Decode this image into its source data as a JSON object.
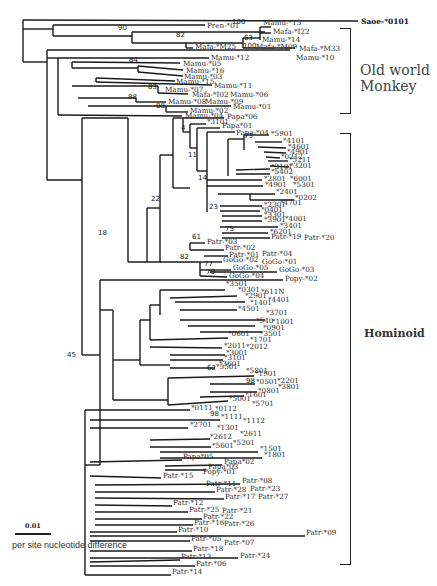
{
  "figure": {
    "type": "phylogenetic-tree",
    "outgroup": "Saoe-*0101",
    "groups": [
      {
        "label_line1": "Old world",
        "label_line2": "Monkey"
      },
      {
        "label": "Hominoid"
      }
    ],
    "scale": {
      "value": "0.01",
      "caption": "per site nucleotide difference"
    }
  },
  "leaves": [
    {
      "t": "Saoe-*0101",
      "x": 361,
      "y": 22,
      "bold": true
    },
    {
      "t": "Pren-*01",
      "x": 207,
      "y": 26
    },
    {
      "t": "Mamu-*13",
      "x": 263,
      "y": 23
    },
    {
      "t": "Mafa-*I22",
      "x": 273,
      "y": 32
    },
    {
      "t": "Mamu-*14",
      "x": 262,
      "y": 40
    },
    {
      "t": "Mafa-*M25",
      "x": 195,
      "y": 47
    },
    {
      "t": "Mafa-*M09",
      "x": 256,
      "y": 47
    },
    {
      "t": "Mafa-*M33",
      "x": 299,
      "y": 49
    },
    {
      "t": "Mamu-*10",
      "x": 296,
      "y": 58
    },
    {
      "t": "Mamu-*12",
      "x": 211,
      "y": 58
    },
    {
      "t": "Mamu-*05",
      "x": 183,
      "y": 64
    },
    {
      "t": "Mamu-*16",
      "x": 186,
      "y": 71
    },
    {
      "t": "Mamu-*03",
      "x": 184,
      "y": 77
    },
    {
      "t": "Mamu-*15",
      "x": 176,
      "y": 82
    },
    {
      "t": "Mamu-*11",
      "x": 214,
      "y": 86
    },
    {
      "t": "Mamu-*07",
      "x": 165,
      "y": 90
    },
    {
      "t": "Mafa-*I02",
      "x": 192,
      "y": 95
    },
    {
      "t": "Mamu-*06",
      "x": 230,
      "y": 95
    },
    {
      "t": "Mamu-*08",
      "x": 168,
      "y": 102
    },
    {
      "t": "Mamu-*09",
      "x": 205,
      "y": 102
    },
    {
      "t": "Mamu-*01",
      "x": 233,
      "y": 107
    },
    {
      "t": "Mamu-*02",
      "x": 190,
      "y": 111
    },
    {
      "t": "Mamu-*04",
      "x": 185,
      "y": 116
    },
    {
      "t": "Papa*06",
      "x": 227,
      "y": 117
    },
    {
      "t": "*3101",
      "x": 207,
      "y": 122
    },
    {
      "t": "Papa*01",
      "x": 222,
      "y": 126
    },
    {
      "t": "Papa-*04",
      "x": 236,
      "y": 133
    },
    {
      "t": "*5901",
      "x": 271,
      "y": 134
    },
    {
      "t": "*4101",
      "x": 283,
      "y": 141
    },
    {
      "t": "*4601",
      "x": 288,
      "y": 147
    },
    {
      "t": "*4901",
      "x": 287,
      "y": 152
    },
    {
      "t": "*0212",
      "x": 281,
      "y": 157
    },
    {
      "t": "*5211",
      "x": 289,
      "y": 160
    },
    {
      "t": "*3201",
      "x": 290,
      "y": 166
    },
    {
      "t": "*3101",
      "x": 271,
      "y": 167
    },
    {
      "t": "*5402",
      "x": 271,
      "y": 172
    },
    {
      "t": "*2801",
      "x": 264,
      "y": 179
    },
    {
      "t": "*6001",
      "x": 290,
      "y": 179
    },
    {
      "t": "*4901",
      "x": 265,
      "y": 185
    },
    {
      "t": "*5301",
      "x": 293,
      "y": 185
    },
    {
      "t": "*2401",
      "x": 276,
      "y": 192
    },
    {
      "t": "*0202",
      "x": 295,
      "y": 198
    },
    {
      "t": "*2301",
      "x": 264,
      "y": 205
    },
    {
      "t": "*4701",
      "x": 280,
      "y": 203
    },
    {
      "t": "*0401",
      "x": 261,
      "y": 210
    },
    {
      "t": "*3301",
      "x": 264,
      "y": 215
    },
    {
      "t": "*3901",
      "x": 264,
      "y": 220
    },
    {
      "t": "*4001",
      "x": 285,
      "y": 219
    },
    {
      "t": "*3401",
      "x": 280,
      "y": 226
    },
    {
      "t": "*6201",
      "x": 270,
      "y": 232
    },
    {
      "t": "Patr-*19",
      "x": 271,
      "y": 237
    },
    {
      "t": "Patr-*20",
      "x": 304,
      "y": 238
    },
    {
      "t": "Patr-*03",
      "x": 207,
      "y": 242
    },
    {
      "t": "Patr-*02",
      "x": 225,
      "y": 248
    },
    {
      "t": "Patr-*01",
      "x": 229,
      "y": 255
    },
    {
      "t": "Patr-*04",
      "x": 262,
      "y": 254
    },
    {
      "t": "GoGo-*02",
      "x": 223,
      "y": 260
    },
    {
      "t": "GoGo-*01",
      "x": 262,
      "y": 262
    },
    {
      "t": "GoGo-*05",
      "x": 233,
      "y": 268
    },
    {
      "t": "GoGo-*03",
      "x": 279,
      "y": 270
    },
    {
      "t": "GoGo-*04",
      "x": 229,
      "y": 276
    },
    {
      "t": "Popy-*02",
      "x": 285,
      "y": 279
    },
    {
      "t": "*3501",
      "x": 226,
      "y": 284
    },
    {
      "t": "*0301",
      "x": 238,
      "y": 290
    },
    {
      "t": "*611N",
      "x": 261,
      "y": 292
    },
    {
      "t": "*2901",
      "x": 245,
      "y": 296
    },
    {
      "t": "*4401",
      "x": 268,
      "y": 300
    },
    {
      "t": "*1401",
      "x": 250,
      "y": 303
    },
    {
      "t": "*4501",
      "x": 238,
      "y": 309
    },
    {
      "t": "*3701",
      "x": 266,
      "y": 313
    },
    {
      "t": "*540",
      "x": 256,
      "y": 321
    },
    {
      "t": "*1001",
      "x": 272,
      "y": 322
    },
    {
      "t": "*0901",
      "x": 263,
      "y": 328
    },
    {
      "t": "*3501",
      "x": 260,
      "y": 334
    },
    {
      "t": "*0601",
      "x": 228,
      "y": 334
    },
    {
      "t": "*1701",
      "x": 250,
      "y": 340
    },
    {
      "t": "*2011",
      "x": 224,
      "y": 346
    },
    {
      "t": "*2012",
      "x": 246,
      "y": 347
    },
    {
      "t": "*3001",
      "x": 226,
      "y": 353
    },
    {
      "t": "*3101",
      "x": 224,
      "y": 358
    },
    {
      "t": "*3601",
      "x": 219,
      "y": 364
    },
    {
      "t": "*5501",
      "x": 216,
      "y": 367
    },
    {
      "t": "*5801",
      "x": 246,
      "y": 371
    },
    {
      "t": "*1901",
      "x": 255,
      "y": 374
    },
    {
      "t": "*0501",
      "x": 256,
      "y": 382
    },
    {
      "t": "*2201",
      "x": 277,
      "y": 381
    },
    {
      "t": "*3801",
      "x": 278,
      "y": 387
    },
    {
      "t": "*0801",
      "x": 258,
      "y": 391
    },
    {
      "t": "*1601",
      "x": 245,
      "y": 395
    },
    {
      "t": "*5001",
      "x": 229,
      "y": 399
    },
    {
      "t": "*5701",
      "x": 252,
      "y": 404
    },
    {
      "t": "*0111",
      "x": 191,
      "y": 408
    },
    {
      "t": "*0112",
      "x": 215,
      "y": 409
    },
    {
      "t": "*1111",
      "x": 221,
      "y": 417
    },
    {
      "t": "*1112",
      "x": 243,
      "y": 421
    },
    {
      "t": "*2701",
      "x": 190,
      "y": 425
    },
    {
      "t": "*1301",
      "x": 217,
      "y": 428
    },
    {
      "t": "*2611",
      "x": 240,
      "y": 434
    },
    {
      "t": "*2612",
      "x": 210,
      "y": 437
    },
    {
      "t": "*5201",
      "x": 233,
      "y": 443
    },
    {
      "t": "*5601",
      "x": 212,
      "y": 446
    },
    {
      "t": "*1501",
      "x": 260,
      "y": 449
    },
    {
      "t": "*1801",
      "x": 264,
      "y": 455
    },
    {
      "t": "Papa*05",
      "x": 183,
      "y": 457
    },
    {
      "t": "Papa*02",
      "x": 224,
      "y": 462
    },
    {
      "t": "Papa*03",
      "x": 208,
      "y": 467
    },
    {
      "t": "Popy-*01",
      "x": 203,
      "y": 472
    },
    {
      "t": "Patr-*15",
      "x": 163,
      "y": 476
    },
    {
      "t": "Patr-*08",
      "x": 242,
      "y": 481
    },
    {
      "t": "Patr-*11",
      "x": 206,
      "y": 484
    },
    {
      "t": "Patr-*28",
      "x": 216,
      "y": 490
    },
    {
      "t": "Patr-*23",
      "x": 250,
      "y": 489
    },
    {
      "t": "Patr-*17",
      "x": 225,
      "y": 497
    },
    {
      "t": "Patr-*27",
      "x": 258,
      "y": 497
    },
    {
      "t": "Patr-*12",
      "x": 173,
      "y": 503
    },
    {
      "t": "Patr-*25",
      "x": 189,
      "y": 510
    },
    {
      "t": "Patr-*21",
      "x": 222,
      "y": 511
    },
    {
      "t": "Patr-*22",
      "x": 203,
      "y": 517
    },
    {
      "t": "Patr-*16",
      "x": 194,
      "y": 523
    },
    {
      "t": "Patr-*26",
      "x": 224,
      "y": 524
    },
    {
      "t": "Patr-*10",
      "x": 178,
      "y": 530
    },
    {
      "t": "Patr-*09",
      "x": 306,
      "y": 533
    },
    {
      "t": "Patr-*05",
      "x": 191,
      "y": 539
    },
    {
      "t": "Patr-*07",
      "x": 224,
      "y": 543
    },
    {
      "t": "Patr-*18",
      "x": 193,
      "y": 549
    },
    {
      "t": "Patr-*24",
      "x": 240,
      "y": 556
    },
    {
      "t": "Patr-*13",
      "x": 181,
      "y": 557
    },
    {
      "t": "Patr-*06",
      "x": 196,
      "y": 564
    },
    {
      "t": "Patr-*14",
      "x": 172,
      "y": 572
    }
  ],
  "bootstrap": [
    {
      "v": "90",
      "x": 118,
      "y": 28
    },
    {
      "v": "100",
      "x": 232,
      "y": 22
    },
    {
      "v": "82",
      "x": 176,
      "y": 35
    },
    {
      "v": "63",
      "x": 244,
      "y": 38
    },
    {
      "v": "100",
      "x": 243,
      "y": 46
    },
    {
      "v": "84",
      "x": 129,
      "y": 60
    },
    {
      "v": "83",
      "x": 148,
      "y": 87
    },
    {
      "v": "88",
      "x": 128,
      "y": 97
    },
    {
      "v": "88",
      "x": 156,
      "y": 106
    },
    {
      "v": "4",
      "x": 181,
      "y": 128
    },
    {
      "v": "11",
      "x": 188,
      "y": 155
    },
    {
      "v": "73",
      "x": 244,
      "y": 136
    },
    {
      "v": "14",
      "x": 198,
      "y": 178
    },
    {
      "v": "23",
      "x": 209,
      "y": 207
    },
    {
      "v": "75",
      "x": 225,
      "y": 229
    },
    {
      "v": "22",
      "x": 151,
      "y": 199
    },
    {
      "v": "61",
      "x": 192,
      "y": 237
    },
    {
      "v": "18",
      "x": 98,
      "y": 233
    },
    {
      "v": "82",
      "x": 180,
      "y": 257
    },
    {
      "v": "77",
      "x": 204,
      "y": 264
    },
    {
      "v": "79",
      "x": 206,
      "y": 272
    },
    {
      "v": "45",
      "x": 67,
      "y": 355
    },
    {
      "v": "62",
      "x": 207,
      "y": 368
    },
    {
      "v": "98",
      "x": 246,
      "y": 381
    },
    {
      "v": "98",
      "x": 210,
      "y": 414
    }
  ]
}
